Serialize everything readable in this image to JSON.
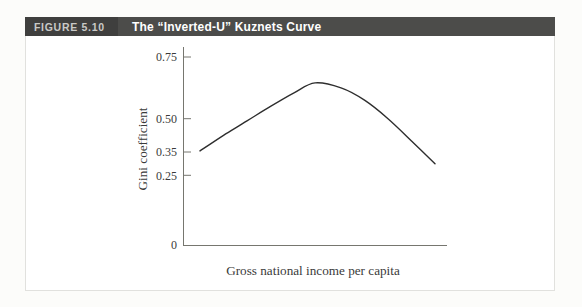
{
  "figure_header": {
    "label": "FIGURE 5.10",
    "title": "The “Inverted-U” Kuznets Curve",
    "bar_color": "#4c4c4a",
    "label_box_color": "#3f3f3e",
    "label_text_color": "#c9c9c7",
    "title_text_color": "#ffffff"
  },
  "chart_data": {
    "type": "line",
    "title": "The “Inverted-U” Kuznets Curve",
    "xlabel": "Gross national income per capita",
    "ylabel": "Gini coefficient",
    "ylim": [
      0,
      0.8
    ],
    "x_axis_ticks": [],
    "y_ticks": [
      {
        "value": 0,
        "label": "0"
      },
      {
        "value": 0.25,
        "label": "0.25"
      },
      {
        "value": 0.35,
        "label": "0.35"
      },
      {
        "value": 0.5,
        "label": "0.50"
      },
      {
        "value": 0.75,
        "label": "0.75"
      }
    ],
    "grid": false,
    "legend": "none",
    "series": [
      {
        "name": "Kuznets inverted-U curve",
        "x_normalized": true,
        "points": [
          [
            0.0,
            0.355
          ],
          [
            0.1,
            0.425
          ],
          [
            0.2,
            0.49
          ],
          [
            0.3,
            0.55
          ],
          [
            0.4,
            0.605
          ],
          [
            0.49,
            0.645
          ],
          [
            0.6,
            0.625
          ],
          [
            0.7,
            0.575
          ],
          [
            0.8,
            0.5
          ],
          [
            0.9,
            0.4
          ],
          [
            1.0,
            0.3
          ]
        ]
      }
    ],
    "axis_color": "#76766f",
    "curve_color": "#2e2e2e",
    "text_color": "#3a3a3a"
  }
}
